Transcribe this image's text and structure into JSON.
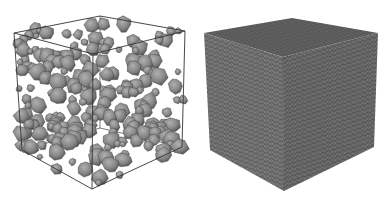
{
  "figure": {
    "panels": [
      {
        "id": "left",
        "description": "Wireframe cube containing randomly packed polyhedral aggregate particles (meshed surfaces)",
        "box_color": "#444444",
        "particle_fill": "#8a8a8a",
        "particle_dark": "#5a5a5a",
        "particle_light": "#a8a8a8"
      },
      {
        "id": "right",
        "description": "Solid cube with fine triangular surface mesh",
        "face_top": "#6a6a6a",
        "face_left": "#7d7d7d",
        "face_right": "#707070",
        "mesh_color": "#3a3a3a"
      }
    ]
  }
}
